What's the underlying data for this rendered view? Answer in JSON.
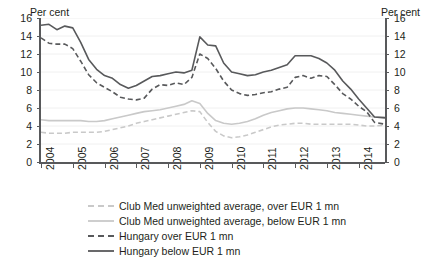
{
  "chart_data": {
    "type": "line",
    "title": "",
    "xlabel": "",
    "ylabel": "Per cent",
    "ylabel_right": "Per cent",
    "ylim": [
      0,
      16
    ],
    "yticks": [
      0,
      2,
      4,
      6,
      8,
      10,
      12,
      14,
      16
    ],
    "xticks": [
      "2004",
      "2005",
      "2006",
      "2007",
      "2008",
      "2009",
      "2010",
      "2011",
      "2012",
      "2013",
      "2014"
    ],
    "xlim": [
      2004.0,
      2014.83
    ],
    "grid": true,
    "legend_position": "below",
    "colors": {
      "light": "#c9c9c9",
      "dark": "#58595b",
      "axis": "#58595b",
      "grid": "#f0f0f0",
      "text": "#231f20",
      "background": "#ffffff"
    },
    "series": [
      {
        "name": "Club Med unweighted average, over EUR 1 mn",
        "color": "#c9c9c9",
        "style": "dashed",
        "x": [
          2004.0,
          2004.25,
          2004.5,
          2004.75,
          2005.0,
          2005.25,
          2005.5,
          2005.75,
          2006.0,
          2006.25,
          2006.5,
          2006.75,
          2007.0,
          2007.25,
          2007.5,
          2007.75,
          2008.0,
          2008.25,
          2008.5,
          2008.75,
          2009.0,
          2009.25,
          2009.5,
          2009.75,
          2010.0,
          2010.25,
          2010.5,
          2010.75,
          2011.0,
          2011.25,
          2011.5,
          2011.75,
          2012.0,
          2012.25,
          2012.5,
          2012.75,
          2013.0,
          2013.25,
          2013.5,
          2013.75,
          2014.0,
          2014.25,
          2014.5,
          2014.83
        ],
        "values": [
          3.3,
          3.2,
          3.2,
          3.2,
          3.3,
          3.3,
          3.3,
          3.3,
          3.4,
          3.6,
          3.8,
          4.0,
          4.3,
          4.5,
          4.7,
          4.9,
          5.1,
          5.3,
          5.5,
          5.7,
          5.6,
          4.4,
          3.4,
          2.9,
          2.7,
          2.8,
          3.0,
          3.3,
          3.6,
          3.9,
          4.1,
          4.2,
          4.3,
          4.3,
          4.2,
          4.2,
          4.2,
          4.2,
          4.2,
          4.2,
          4.1,
          4.0,
          4.0,
          4.1
        ]
      },
      {
        "name": "Club Med unweighted average, below EUR 1 mn",
        "color": "#c9c9c9",
        "style": "solid",
        "x": [
          2004.0,
          2004.25,
          2004.5,
          2004.75,
          2005.0,
          2005.25,
          2005.5,
          2005.75,
          2006.0,
          2006.25,
          2006.5,
          2006.75,
          2007.0,
          2007.25,
          2007.5,
          2007.75,
          2008.0,
          2008.25,
          2008.5,
          2008.75,
          2009.0,
          2009.25,
          2009.5,
          2009.75,
          2010.0,
          2010.25,
          2010.5,
          2010.75,
          2011.0,
          2011.25,
          2011.5,
          2011.75,
          2012.0,
          2012.25,
          2012.5,
          2012.75,
          2013.0,
          2013.25,
          2013.5,
          2013.75,
          2014.0,
          2014.25,
          2014.5,
          2014.83
        ],
        "values": [
          4.7,
          4.6,
          4.6,
          4.6,
          4.6,
          4.6,
          4.5,
          4.5,
          4.6,
          4.8,
          5.0,
          5.2,
          5.4,
          5.6,
          5.7,
          5.8,
          6.0,
          6.2,
          6.4,
          6.8,
          6.5,
          5.4,
          4.6,
          4.3,
          4.2,
          4.3,
          4.5,
          4.8,
          5.2,
          5.5,
          5.7,
          5.9,
          6.0,
          6.0,
          5.9,
          5.8,
          5.7,
          5.5,
          5.4,
          5.3,
          5.2,
          5.1,
          5.0,
          5.0
        ]
      },
      {
        "name": "Hungary over EUR 1 mn",
        "color": "#58595b",
        "style": "dashed",
        "x": [
          2004.0,
          2004.25,
          2004.5,
          2004.75,
          2005.0,
          2005.25,
          2005.5,
          2005.75,
          2006.0,
          2006.25,
          2006.5,
          2006.75,
          2007.0,
          2007.25,
          2007.5,
          2007.75,
          2008.0,
          2008.25,
          2008.5,
          2008.75,
          2009.0,
          2009.25,
          2009.5,
          2009.75,
          2010.0,
          2010.25,
          2010.5,
          2010.75,
          2011.0,
          2011.25,
          2011.5,
          2011.75,
          2012.0,
          2012.25,
          2012.5,
          2012.75,
          2013.0,
          2013.25,
          2013.5,
          2013.75,
          2014.0,
          2014.25,
          2014.5,
          2014.83
        ],
        "values": [
          13.8,
          13.2,
          13.1,
          13.1,
          12.6,
          11.2,
          9.7,
          8.8,
          8.3,
          7.8,
          7.2,
          7.0,
          6.9,
          7.1,
          8.1,
          8.6,
          8.5,
          8.8,
          8.6,
          9.4,
          12.0,
          11.5,
          10.4,
          9.0,
          8.0,
          7.6,
          7.4,
          7.5,
          7.7,
          7.8,
          8.1,
          8.3,
          9.4,
          9.6,
          9.3,
          9.6,
          9.5,
          8.6,
          7.6,
          7.0,
          6.2,
          5.6,
          4.4,
          4.2
        ]
      },
      {
        "name": "Hungary below EUR 1 mn",
        "color": "#58595b",
        "style": "solid",
        "x": [
          2004.0,
          2004.25,
          2004.5,
          2004.75,
          2005.0,
          2005.25,
          2005.5,
          2005.75,
          2006.0,
          2006.25,
          2006.5,
          2006.75,
          2007.0,
          2007.25,
          2007.5,
          2007.75,
          2008.0,
          2008.25,
          2008.5,
          2008.75,
          2009.0,
          2009.25,
          2009.5,
          2009.75,
          2010.0,
          2010.25,
          2010.5,
          2010.75,
          2011.0,
          2011.25,
          2011.5,
          2011.75,
          2012.0,
          2012.25,
          2012.5,
          2012.75,
          2013.0,
          2013.25,
          2013.5,
          2013.75,
          2014.0,
          2014.25,
          2014.5,
          2014.83
        ],
        "values": [
          15.2,
          15.3,
          14.7,
          15.1,
          14.9,
          13.3,
          11.4,
          10.3,
          9.6,
          9.3,
          8.6,
          8.2,
          8.5,
          9.0,
          9.5,
          9.6,
          9.8,
          10.0,
          9.9,
          10.2,
          13.9,
          13.0,
          12.9,
          11.0,
          10.0,
          9.8,
          9.6,
          9.7,
          10.0,
          10.2,
          10.5,
          10.8,
          11.8,
          11.8,
          11.8,
          11.5,
          11.0,
          10.2,
          9.0,
          8.1,
          7.0,
          6.0,
          5.0,
          4.9
        ]
      }
    ]
  },
  "legend": {
    "items": [
      {
        "label": "Club Med unweighted average, over EUR 1 mn"
      },
      {
        "label": "Club Med unweighted average, below EUR 1 mn"
      },
      {
        "label": "Hungary over EUR 1 mn"
      },
      {
        "label": "Hungary below EUR 1 mn"
      }
    ]
  }
}
